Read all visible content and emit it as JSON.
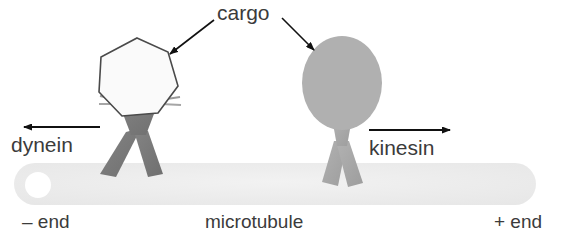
{
  "figure": {
    "width": 576,
    "height": 248,
    "background": "#ffffff"
  },
  "labels": {
    "cargo": "cargo",
    "dynein": "dynein",
    "kinesin": "kinesin",
    "minus_end": "– end",
    "microtubule": "microtubule",
    "plus_end": "+ end"
  },
  "colors": {
    "text": "#3b3b3b",
    "microtubule_fill": "#ededed",
    "dynein_body": "#7a7a7a",
    "dynein_cargo_fill": "#fafafa",
    "dynein_cargo_stroke": "#4a4a4a",
    "kinesin_body": "#a8a8a8",
    "kinesin_cargo_fill": "#b0b0b0",
    "arrow_stroke": "#111111",
    "white_circle": "#ffffff"
  },
  "elements": {
    "microtubule": {
      "name": "microtubule",
      "shape": "rounded-bar",
      "x": 14,
      "y": 163,
      "width": 522,
      "height": 42,
      "radius": 21
    },
    "minus_end_circle": {
      "name": "minus-end-marker",
      "cx": 38,
      "cy": 185,
      "r": 13
    },
    "dynein_motor": {
      "name": "dynein-motor",
      "direction": "minus",
      "cargo_shape": "polygon",
      "cargo_cx": 137,
      "cargo_cy": 78,
      "cargo_r": 41
    },
    "kinesin_motor": {
      "name": "kinesin-motor",
      "direction": "plus",
      "cargo_shape": "oval",
      "cargo_cx": 342,
      "cargo_cy": 83,
      "cargo_rx": 40,
      "cargo_ry": 47
    },
    "dynein_arrow": {
      "name": "dynein-direction-arrow",
      "from_x": 100,
      "from_y": 127,
      "to_x": 22,
      "to_y": 127
    },
    "kinesin_arrow": {
      "name": "kinesin-direction-arrow",
      "from_x": 369,
      "from_y": 130,
      "to_x": 452,
      "to_y": 130
    },
    "cargo_arrow_left": {
      "name": "cargo-pointer-left",
      "from_x": 214,
      "from_y": 20,
      "to_x": 168,
      "to_y": 56
    },
    "cargo_arrow_right": {
      "name": "cargo-pointer-right",
      "from_x": 282,
      "from_y": 18,
      "to_x": 316,
      "to_y": 52
    }
  }
}
